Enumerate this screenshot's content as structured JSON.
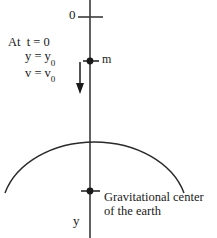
{
  "figure": {
    "title_semantic": "free-fall-toward-earth-gravitational-center",
    "background_color": "#ffffff",
    "ink_color": "#1a1a1a",
    "width": 217,
    "height": 238
  },
  "axis": {
    "name": "vertical y axis",
    "origin_label": "0",
    "axis_label": "y",
    "direction": "downward positive",
    "x_position": 90,
    "top_tick_y": 17,
    "line_top_y": 0,
    "line_bottom_y": 238
  },
  "initial_conditions": {
    "prefix": "At",
    "time_line": "t = 0",
    "position_line": {
      "lhs": "y",
      "eq": "=",
      "rhs_base": "y",
      "rhs_sub": "0"
    },
    "velocity_line": {
      "lhs": "v",
      "eq": "=",
      "rhs_base": "v",
      "rhs_sub": "0"
    }
  },
  "mass": {
    "label": "m",
    "marker": "filled-dot",
    "y_position": 61
  },
  "velocity_arrow": {
    "name": "initial-velocity-arrow",
    "direction": "down",
    "x_position": 80,
    "start_y": 62,
    "end_y": 93
  },
  "earth": {
    "shape": "arc",
    "apex_y": 124,
    "left_end_x": 5,
    "right_end_x": 184,
    "end_y": 192,
    "center_marker": "filled-dot",
    "center_y": 191,
    "caption": {
      "line1": "Gravitational center",
      "line2": "of the earth"
    }
  }
}
